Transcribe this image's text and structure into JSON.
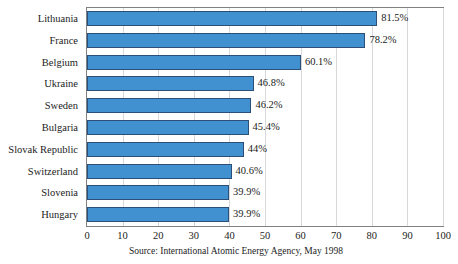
{
  "chart_data": {
    "type": "bar",
    "orientation": "horizontal",
    "title": "",
    "xlabel": "",
    "ylabel": "",
    "xlim": [
      0,
      100
    ],
    "xticks": [
      "0",
      "10",
      "20",
      "30",
      "40",
      "50",
      "60",
      "70",
      "80",
      "90",
      "100"
    ],
    "grid": true,
    "legend": false,
    "unit": "%",
    "categories": [
      "Lithuania",
      "France",
      "Belgium",
      "Ukraine",
      "Sweden",
      "Bulgaria",
      "Slovak Republic",
      "Switzerland",
      "Slovenia",
      "Hungary"
    ],
    "values": [
      81.5,
      78.2,
      60.1,
      46.8,
      46.2,
      45.4,
      44,
      40.6,
      39.9,
      39.9
    ],
    "value_labels": [
      "81.5%",
      "78.2%",
      "60.1%",
      "46.8%",
      "46.2%",
      "45.4%",
      "44%",
      "40.6%",
      "39.9%",
      "39.9%"
    ],
    "bar_color": "#4190d0",
    "bar_border_color": "#2b4f77",
    "grid_color": "#d8d8dc",
    "frame_color": "#808084"
  },
  "footer": {
    "source": "Source: International Atomic Energy Agency, May 1998"
  },
  "header": {
    "clipped_title": ""
  }
}
